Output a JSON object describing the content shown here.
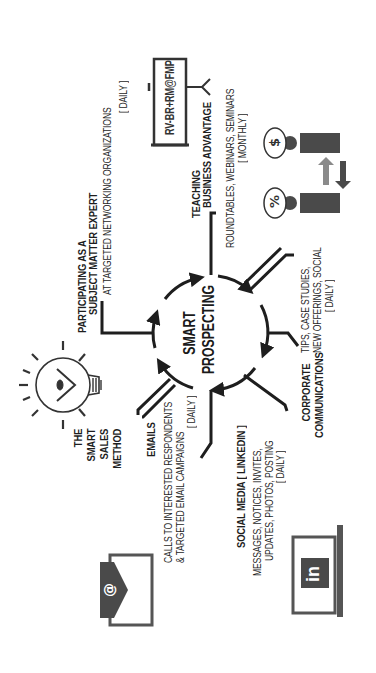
{
  "diagram": {
    "orientation": "rotated -90deg (reads bottom-to-top)",
    "center": {
      "line1": "SMART",
      "line2": "PROSPECTING"
    },
    "nodes": [
      {
        "id": "smart-sales-method",
        "lines": [
          "THE",
          "SMART",
          "SALES",
          "METHOD"
        ],
        "icon": "lightbulb-icon"
      },
      {
        "id": "subject-matter-expert",
        "lines": [
          "PARTICIPATING AS A",
          "SUBJECT MATTER EXPERT",
          "AT TARGETED NETWORKING ORGANIZATIONS",
          "[ DAILY ]"
        ]
      },
      {
        "id": "teaching",
        "lines": [
          "TEACHING",
          "BUSINESS ADVANTAGE",
          "ROUNDTABLES, WEBINARS, SEMINARS",
          "[ MONTHLY ]"
        ],
        "icon": "signpost-icon",
        "sign_text": "RV-BR+RM@FMP"
      },
      {
        "id": "corporate-communications",
        "lines": [
          "CORPORATE",
          "COMMUNICATIONS",
          "TIPS, CASE STUDIES,",
          "NEW OFFERINGS, SOCIAL",
          "[ DAILY ]"
        ],
        "icon": "people-exchange-icon"
      },
      {
        "id": "social-media",
        "lines": [
          "SOCIAL MEDIA [ LINKEDIN ]",
          "MESSAGES, NOTICES, INVITES,",
          "UPDATES, PHOTOS, POSTING",
          "[ DAILY ]"
        ],
        "icon": "linkedin-laptop-icon"
      },
      {
        "id": "emails",
        "lines": [
          "EMAILS",
          "CALLS TO INTERESTED RESPONDENTS",
          "& TARGETED EMAIL CAMPAIGNS",
          "[ DAILY ]"
        ],
        "icon": "email-envelope-icon"
      }
    ],
    "icon_glyphs": {
      "email": "@",
      "linkedin": "in",
      "percent": "%",
      "dollar": "$"
    },
    "colors": {
      "ink": "#1e1e1e",
      "icon_gray": "#4a4a4a",
      "arrow_light": "#8a8a8a",
      "background": "#ffffff"
    }
  }
}
